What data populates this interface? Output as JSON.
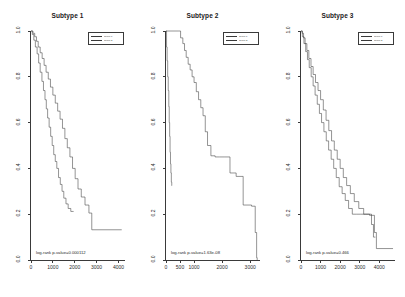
{
  "figure": {
    "kind": "kaplan-meier-survival-panels",
    "panel_count": 3
  },
  "chart_data": [
    {
      "type": "line",
      "title": "Subtype 1",
      "xlabel": "",
      "ylabel": "",
      "xlim": [
        0,
        4300
      ],
      "ylim": [
        0,
        1.0
      ],
      "xticks": [
        0,
        1000,
        2000,
        3000,
        4000
      ],
      "xticklabels": [
        "0",
        "1000",
        "2000",
        "3000",
        "4000"
      ],
      "yticks": [
        0.0,
        0.2,
        0.4,
        0.6,
        0.8,
        1.0
      ],
      "yticklabels": [
        "0.0",
        "0.2",
        "0.4",
        "0.6",
        "0.8",
        "1.0"
      ],
      "grid": false,
      "legend_position": "top-right",
      "annotation": "log-rank p-value=0.000112",
      "legend": [
        "group 1",
        "group 2"
      ],
      "series": [
        {
          "name": "group 1",
          "step": "post",
          "x": [
            0,
            60,
            130,
            200,
            280,
            350,
            420,
            500,
            570,
            640,
            700,
            760,
            830,
            900,
            970,
            1040,
            1110,
            1180,
            1260,
            1340,
            1420,
            1500,
            1600,
            1700,
            1820,
            1950
          ],
          "y": [
            1.0,
            0.985,
            0.96,
            0.93,
            0.9,
            0.86,
            0.82,
            0.78,
            0.74,
            0.7,
            0.66,
            0.62,
            0.58,
            0.54,
            0.5,
            0.46,
            0.43,
            0.4,
            0.36,
            0.33,
            0.3,
            0.27,
            0.245,
            0.225,
            0.212,
            0.212
          ]
        },
        {
          "name": "group 2",
          "step": "post",
          "x": [
            0,
            90,
            170,
            250,
            330,
            420,
            510,
            600,
            690,
            790,
            890,
            1000,
            1110,
            1220,
            1330,
            1440,
            1550,
            1660,
            1780,
            1900,
            2020,
            2150,
            2300,
            2470,
            2650,
            2780,
            4150
          ],
          "y": [
            1.0,
            0.99,
            0.975,
            0.955,
            0.93,
            0.905,
            0.88,
            0.85,
            0.82,
            0.79,
            0.755,
            0.72,
            0.685,
            0.65,
            0.615,
            0.575,
            0.53,
            0.49,
            0.45,
            0.4,
            0.355,
            0.31,
            0.275,
            0.24,
            0.205,
            0.132,
            0.132
          ]
        }
      ]
    },
    {
      "type": "line",
      "title": "Subtype 2",
      "xlabel": "",
      "ylabel": "",
      "xlim": [
        0,
        3350
      ],
      "ylim": [
        0,
        1.0
      ],
      "xticks": [
        0,
        500,
        1000,
        2000,
        3000
      ],
      "xticklabels": [
        "0",
        "500",
        "1000",
        "2000",
        "3000"
      ],
      "yticks": [
        0.0,
        0.2,
        0.4,
        0.6,
        0.8,
        1.0
      ],
      "yticklabels": [
        "0.0",
        "0.2",
        "0.4",
        "0.6",
        "0.8",
        "1.0"
      ],
      "grid": false,
      "legend_position": "top-right",
      "annotation": "log-rank p-value=1.63e-08",
      "legend": [
        "group 1",
        "group 2"
      ],
      "series": [
        {
          "name": "group 1",
          "step": "post",
          "x": [
            0,
            20,
            40,
            60,
            80,
            100,
            115,
            130,
            145,
            160,
            175,
            190,
            205,
            215
          ],
          "y": [
            1.0,
            0.93,
            0.87,
            0.8,
            0.74,
            0.67,
            0.6,
            0.54,
            0.47,
            0.42,
            0.38,
            0.34,
            0.325,
            0.325
          ]
        },
        {
          "name": "group 2",
          "step": "post",
          "x": [
            0,
            430,
            520,
            600,
            660,
            720,
            790,
            860,
            930,
            1000,
            1080,
            1160,
            1240,
            1320,
            1400,
            1480,
            1600,
            1750,
            1900,
            2100,
            2280,
            2500,
            2750,
            3050,
            3180,
            3230,
            3250
          ],
          "y": [
            1.0,
            1.0,
            0.97,
            0.945,
            0.915,
            0.885,
            0.855,
            0.83,
            0.8,
            0.775,
            0.735,
            0.7,
            0.665,
            0.63,
            0.56,
            0.5,
            0.455,
            0.45,
            0.45,
            0.45,
            0.38,
            0.365,
            0.24,
            0.235,
            0.12,
            0.01,
            0.0
          ]
        }
      ]
    },
    {
      "type": "line",
      "title": "Subtype 3",
      "xlabel": "",
      "ylabel": "",
      "xlim": [
        0,
        4800
      ],
      "ylim": [
        0,
        1.0
      ],
      "xticks": [
        0,
        1000,
        2000,
        3000,
        4000
      ],
      "xticklabels": [
        "0",
        "1000",
        "2000",
        "3000",
        "4000"
      ],
      "yticks": [
        0.0,
        0.2,
        0.4,
        0.6,
        0.8,
        1.0
      ],
      "yticklabels": [
        "0.0",
        "0.2",
        "0.4",
        "0.6",
        "0.8",
        "1.0"
      ],
      "grid": false,
      "legend_position": "top-right",
      "annotation": "log-rank p-value=0.466",
      "legend": [
        "group 1",
        "group 2"
      ],
      "series": [
        {
          "name": "group 1",
          "step": "post",
          "x": [
            0,
            70,
            150,
            240,
            330,
            420,
            520,
            620,
            720,
            830,
            940,
            1050,
            1170,
            1290,
            1410,
            1540,
            1670,
            1800,
            1950,
            2100,
            2260,
            2430,
            2620,
            2820,
            3050,
            3300,
            3600,
            3700,
            3800
          ],
          "y": [
            1.0,
            0.975,
            0.945,
            0.91,
            0.875,
            0.84,
            0.8,
            0.76,
            0.72,
            0.68,
            0.64,
            0.6,
            0.56,
            0.52,
            0.48,
            0.44,
            0.4,
            0.36,
            0.32,
            0.29,
            0.26,
            0.225,
            0.2,
            0.2,
            0.2,
            0.2,
            0.155,
            0.1,
            0.1
          ]
        },
        {
          "name": "group 2",
          "step": "post",
          "x": [
            0,
            60,
            130,
            210,
            300,
            400,
            510,
            620,
            740,
            870,
            1000,
            1140,
            1280,
            1420,
            1560,
            1700,
            1850,
            2000,
            2160,
            2330,
            2520,
            2720,
            2950,
            3200,
            3500,
            3750,
            3850,
            4700
          ],
          "y": [
            1.0,
            0.99,
            0.97,
            0.945,
            0.915,
            0.88,
            0.845,
            0.81,
            0.775,
            0.74,
            0.7,
            0.655,
            0.61,
            0.565,
            0.52,
            0.48,
            0.44,
            0.4,
            0.36,
            0.325,
            0.29,
            0.255,
            0.225,
            0.2,
            0.195,
            0.12,
            0.05,
            0.05
          ]
        }
      ]
    }
  ]
}
